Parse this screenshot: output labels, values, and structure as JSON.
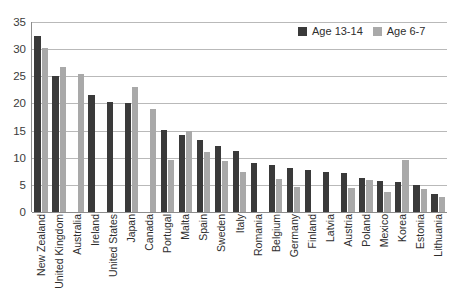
{
  "chart_data": {
    "type": "bar",
    "title": "",
    "subtitle": "",
    "xlabel": "",
    "ylabel": "",
    "ylim": [
      0,
      35
    ],
    "yticks": [
      0,
      5,
      10,
      15,
      20,
      25,
      30,
      35
    ],
    "grid": true,
    "legend_position": "top-right",
    "categories": [
      "New Zealand",
      "United Kingdom",
      "Australia",
      "Ireland",
      "United States",
      "Japan",
      "Canada",
      "Portugal",
      "Malta",
      "Spain",
      "Sweden",
      "Italy",
      "Romania",
      "Belgium",
      "Germany",
      "Finland",
      "Latvia",
      "Austria",
      "Poland",
      "Mexico",
      "Korea",
      "Estonia",
      "Lithuania"
    ],
    "series": [
      {
        "name": "Age 13-14",
        "color": "#3a3a3a",
        "values": [
          32.5,
          25.0,
          null,
          21.5,
          20.2,
          20.0,
          null,
          15.1,
          14.2,
          13.2,
          12.1,
          11.3,
          9.0,
          8.6,
          8.1,
          7.8,
          7.3,
          7.1,
          6.2,
          5.8,
          5.5,
          4.9,
          3.4
        ]
      },
      {
        "name": "Age 6-7",
        "color": "#a9a9a9",
        "values": [
          30.2,
          26.7,
          25.5,
          null,
          null,
          23.0,
          19.0,
          9.5,
          15.0,
          11.1,
          9.4,
          7.4,
          null,
          6.1,
          4.7,
          null,
          null,
          4.4,
          5.9,
          3.7,
          9.5,
          4.2,
          2.8
        ]
      }
    ]
  },
  "legend": {
    "items": [
      {
        "label": "Age 13-14",
        "swatch": "dark-square-swatch"
      },
      {
        "label": "Age 6-7",
        "swatch": "light-square-swatch"
      }
    ]
  }
}
